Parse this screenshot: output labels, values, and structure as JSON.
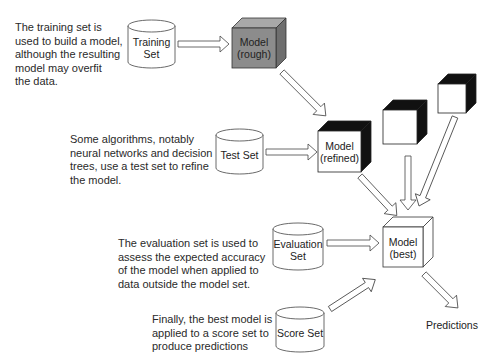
{
  "notes": {
    "training": "The training set is\nused to build a model,\nalthough the resulting\nmodel may overfit\nthe data.",
    "test": "Some algorithms, notably\nneural networks and decision\ntrees, use a test set to refine\nthe model.",
    "evaluation": "The evaluation set is used to\nassess the expected accuracy\nof the model when applied to\ndata outside the model set.",
    "score": "Finally, the best model is\napplied to a score set to\nproduce predictions"
  },
  "datasets": {
    "training": "Training\nSet",
    "test": "Test Set",
    "evaluation": "Evaluation\nSet",
    "score": "Score Set"
  },
  "models": {
    "rough": "Model\n(rough)",
    "refined": "Model\n(refined)",
    "best": "Model\n(best)"
  },
  "output": {
    "predictions": "Predictions"
  },
  "colors": {
    "rough_fill": "#8c8c8c",
    "dark_face": "#111111",
    "outline": "#444444"
  }
}
